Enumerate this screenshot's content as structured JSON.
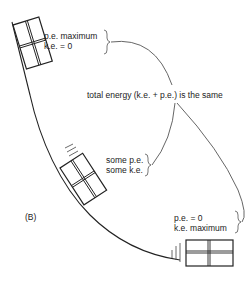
{
  "diagram": {
    "panel_label": "(B)",
    "center_label": "total energy (k.e. + p.e.) is the same",
    "positions": [
      {
        "id": "top",
        "pe": "p.e. maximum",
        "ke": "k.e. = 0"
      },
      {
        "id": "middle",
        "pe": "some p.e.",
        "ke": "some k.e."
      },
      {
        "id": "bottom",
        "pe": "p.e. = 0",
        "ke": "k.e. maximum"
      }
    ],
    "colors": {
      "line": "#222222",
      "background": "#ffffff",
      "connector": "#555555"
    }
  }
}
